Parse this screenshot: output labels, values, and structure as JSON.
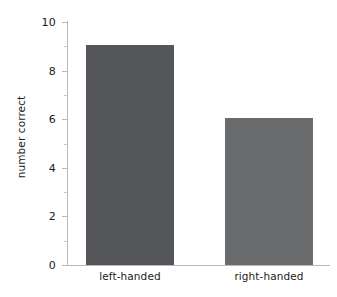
{
  "chart_data": {
    "type": "bar",
    "title": "",
    "xlabel": "",
    "ylabel": "number correct",
    "categories": [
      "left-handed",
      "right-handed"
    ],
    "values": [
      9,
      6
    ],
    "ylim": [
      0,
      10
    ],
    "yticks": [
      0,
      2,
      4,
      6,
      8,
      10
    ],
    "ytick_labels": [
      "0",
      "2",
      "4",
      "6",
      "8",
      "10"
    ],
    "yminor_ticks": [
      1,
      3,
      5,
      7,
      9
    ],
    "grid": false,
    "legend": null,
    "bar_colors": [
      "#55565a",
      "#6a6b6d"
    ],
    "background_color": "#ffffff",
    "axis_color": "#b9b9b9",
    "text_color": "#1b1b1b"
  }
}
